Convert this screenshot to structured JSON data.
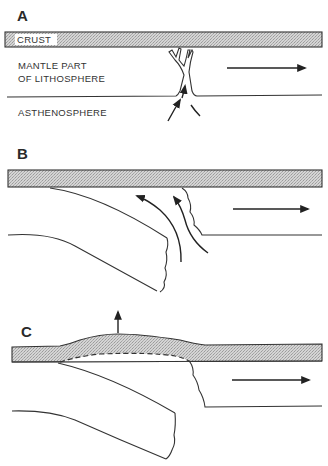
{
  "figure": {
    "panels": [
      {
        "id": "A",
        "label": "A",
        "layers": {
          "crust": "CRUST",
          "mantle_lithosphere_line1": "MANTLE PART",
          "mantle_lithosphere_line2": "OF LITHOSPHERE",
          "asthenosphere": "ASTHENOSPHERE"
        },
        "features": [
          "rift-crack",
          "upwelling-arrow",
          "plate-motion-arrow-right"
        ]
      },
      {
        "id": "B",
        "label": "B",
        "features": [
          "detached-lithosphere-slab",
          "two-upwelling-arrows",
          "plate-motion-arrow-right"
        ]
      },
      {
        "id": "C",
        "label": "C",
        "features": [
          "crustal-bulge",
          "uplift-arrow",
          "underplated-dashed-boundary",
          "sinking-slab",
          "plate-motion-arrow-right"
        ]
      }
    ],
    "colors": {
      "crust_fill": "#c8c8c8",
      "line": "#333333",
      "background": "#ffffff"
    }
  }
}
